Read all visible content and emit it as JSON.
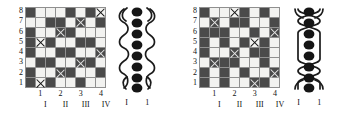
{
  "figure": {
    "type": "weaving-pattern-diagram",
    "panel_count": 2,
    "colors": {
      "dark_cell": "#4a4a4a",
      "light_cell": "#f2f2f0",
      "grid_line": "#8f8f8f",
      "ink": "#111111",
      "background": "#ffffff"
    }
  },
  "panels": [
    {
      "id": "left",
      "grid": {
        "rows": 8,
        "cols": 8,
        "row_labels": [
          "8",
          "7",
          "6",
          "5",
          "4",
          "3",
          "2",
          "1"
        ],
        "col_labels": [
          "1",
          "2",
          "3",
          "4"
        ],
        "col_label_positions": [
          1,
          3,
          5,
          7
        ],
        "roman_labels": [
          "I",
          "II",
          "III",
          "IV"
        ],
        "roman_label_positions": [
          1,
          3,
          5,
          7
        ],
        "cells": [
          [
            "dark",
            "light",
            "light",
            "light",
            "dark",
            "light",
            "dark",
            "light-x"
          ],
          [
            "light",
            "light",
            "dark",
            "dark",
            "light",
            "dark-x",
            "light",
            "dark"
          ],
          [
            "dark",
            "light",
            "light",
            "dark-x",
            "dark",
            "light",
            "light",
            "light"
          ],
          [
            "dark",
            "light-x",
            "dark",
            "light",
            "light",
            "dark",
            "dark",
            "light"
          ],
          [
            "dark",
            "light",
            "light",
            "dark",
            "dark",
            "light",
            "light",
            "dark-x"
          ],
          [
            "light",
            "dark",
            "dark",
            "light",
            "light",
            "dark-x",
            "dark",
            "light"
          ],
          [
            "dark",
            "light",
            "light",
            "dark-x",
            "dark",
            "light",
            "light",
            "dark"
          ],
          [
            "dark",
            "light-x",
            "dark",
            "light",
            "light",
            "dark",
            "light",
            "light"
          ]
        ]
      },
      "cord": {
        "bead_count": 8,
        "style": "offset-loops",
        "labels": [
          "I",
          "1"
        ]
      }
    },
    {
      "id": "right",
      "grid": {
        "rows": 8,
        "cols": 8,
        "row_labels": [
          "8",
          "7",
          "6",
          "5",
          "4",
          "3",
          "2",
          "1"
        ],
        "col_labels": [
          "1",
          "2",
          "3",
          "4"
        ],
        "col_label_positions": [
          1,
          3,
          5,
          7
        ],
        "roman_labels": [
          "I",
          "II",
          "III",
          "IV"
        ],
        "roman_label_positions": [
          1,
          3,
          5,
          7
        ],
        "cells": [
          [
            "dark",
            "light",
            "light",
            "light-x",
            "dark",
            "light",
            "dark",
            "light"
          ],
          [
            "light",
            "dark-x",
            "light",
            "dark",
            "dark",
            "light",
            "light",
            "dark"
          ],
          [
            "dark",
            "dark",
            "dark",
            "light",
            "light",
            "dark",
            "light",
            "dark-x"
          ],
          [
            "dark",
            "light",
            "dark",
            "light",
            "dark",
            "light-x",
            "dark",
            "light"
          ],
          [
            "dark",
            "light",
            "light",
            "dark-x",
            "light",
            "dark",
            "dark",
            "light"
          ],
          [
            "light",
            "dark-x",
            "dark",
            "dark",
            "light",
            "light",
            "dark",
            "light"
          ],
          [
            "dark",
            "light",
            "dark",
            "light",
            "dark",
            "light",
            "light",
            "dark-x"
          ],
          [
            "dark",
            "light",
            "dark",
            "light",
            "light",
            "dark-x",
            "dark",
            "light"
          ]
        ]
      },
      "cord": {
        "bead_count": 8,
        "style": "symmetric-crossings",
        "labels": [
          "I",
          "1"
        ]
      }
    }
  ]
}
